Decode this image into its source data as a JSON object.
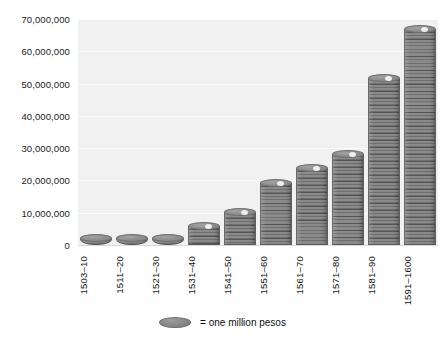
{
  "chart_data": {
    "type": "bar",
    "title": "",
    "xlabel": "",
    "ylabel": "",
    "ylim": [
      0,
      70000000
    ],
    "ytick_step": 10000000,
    "grid": true,
    "legend_position": "bottom",
    "unit_note": "= one million pesos",
    "categories": [
      "1503–10",
      "1511–20",
      "1521–30",
      "1531–40",
      "1541–50",
      "1551–60",
      "1561–70",
      "1571–80",
      "1581–90",
      "1591–1600"
    ],
    "values": [
      2000000,
      2000000,
      1500000,
      5500000,
      10000000,
      19000000,
      23500000,
      28000000,
      51500000,
      66500000
    ],
    "ytick_labels": [
      "0",
      "10,000,000",
      "20,000,000",
      "30,000,000",
      "40,000,000",
      "50,000,000",
      "60,000,000",
      "70,000,000"
    ],
    "ytick_values": [
      0,
      10000000,
      20000000,
      30000000,
      40000000,
      50000000,
      60000000,
      70000000
    ]
  },
  "legend": {
    "swatch_icon": "coin-stack-icon",
    "label": "= one million pesos"
  },
  "colors": {
    "page_background": "#ffffff",
    "plot_background": "#f1f1f1",
    "gridline": "#fcfcfc",
    "bar_fill": "#8a8a8a",
    "bar_ridge": "#5f5f5f",
    "text": "#111111"
  }
}
